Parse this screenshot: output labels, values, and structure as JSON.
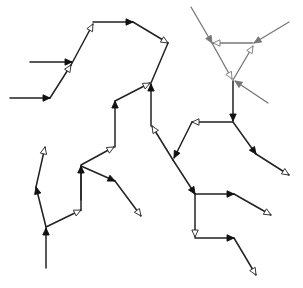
{
  "diagram": {
    "title": "",
    "colors": {
      "edge_primary": "#222222",
      "edge_secondary": "#777777",
      "arrow_filled": "#111111",
      "arrow_open_fill": "#ffffff",
      "background": "#ffffff"
    },
    "edges": [
      {
        "id": "e1",
        "from": [
          30,
          62
        ],
        "to": [
          72,
          62
        ],
        "head": "filled",
        "style": "primary"
      },
      {
        "id": "e2",
        "from": [
          10,
          98
        ],
        "to": [
          50,
          98
        ],
        "head": "filled",
        "style": "primary"
      },
      {
        "id": "e3",
        "from": [
          50,
          98
        ],
        "to": [
          71,
          65
        ],
        "head": "open",
        "style": "primary"
      },
      {
        "id": "e4",
        "from": [
          71,
          65
        ],
        "to": [
          93,
          24
        ],
        "head": "open",
        "style": "primary"
      },
      {
        "id": "e5",
        "from": [
          93,
          22
        ],
        "to": [
          133,
          22
        ],
        "head": "filled",
        "style": "primary"
      },
      {
        "id": "e6",
        "from": [
          133,
          22
        ],
        "to": [
          168,
          43
        ],
        "head": "open",
        "style": "primary"
      },
      {
        "id": "e7",
        "from": [
          168,
          43
        ],
        "to": [
          151,
          83
        ],
        "head": "none",
        "style": "primary"
      },
      {
        "id": "e8",
        "from": [
          115,
          101
        ],
        "to": [
          150,
          83
        ],
        "head": "open",
        "style": "primary"
      },
      {
        "id": "e9",
        "from": [
          151,
          126
        ],
        "to": [
          151,
          84
        ],
        "head": "filled",
        "style": "primary"
      },
      {
        "id": "e10",
        "from": [
          173,
          160
        ],
        "to": [
          152,
          126
        ],
        "head": "open",
        "style": "primary"
      },
      {
        "id": "e11",
        "from": [
          115,
          147
        ],
        "to": [
          115,
          101
        ],
        "head": "filled",
        "style": "primary"
      },
      {
        "id": "e12",
        "from": [
          81,
          165
        ],
        "to": [
          114,
          147
        ],
        "head": "open",
        "style": "primary"
      },
      {
        "id": "e13",
        "from": [
          81,
          200
        ],
        "to": [
          81,
          166
        ],
        "head": "none",
        "style": "primary"
      },
      {
        "id": "e14",
        "from": [
          81,
          166
        ],
        "to": [
          115,
          181
        ],
        "head": "filled",
        "style": "primary"
      },
      {
        "id": "e15",
        "from": [
          115,
          181
        ],
        "to": [
          141,
          216
        ],
        "head": "open",
        "style": "primary"
      },
      {
        "id": "e16",
        "from": [
          46,
          268
        ],
        "to": [
          46,
          228
        ],
        "head": "filled",
        "style": "primary"
      },
      {
        "id": "e17",
        "from": [
          46,
          227
        ],
        "to": [
          81,
          210
        ],
        "head": "open",
        "style": "primary"
      },
      {
        "id": "e18",
        "from": [
          81,
          210
        ],
        "to": [
          81,
          166
        ],
        "head": "filled",
        "style": "primary"
      },
      {
        "id": "e19",
        "from": [
          46,
          227
        ],
        "to": [
          36,
          187
        ],
        "head": "filled",
        "style": "primary"
      },
      {
        "id": "e20",
        "from": [
          36,
          187
        ],
        "to": [
          45,
          147
        ],
        "head": "open",
        "style": "primary"
      },
      {
        "id": "e21",
        "from": [
          173,
          160
        ],
        "to": [
          195,
          194
        ],
        "head": "filled",
        "style": "primary"
      },
      {
        "id": "e22",
        "from": [
          195,
          194
        ],
        "to": [
          234,
          194
        ],
        "head": "filled",
        "style": "primary"
      },
      {
        "id": "e23",
        "from": [
          234,
          194
        ],
        "to": [
          271,
          215
        ],
        "head": "open",
        "style": "primary"
      },
      {
        "id": "e24",
        "from": [
          195,
          194
        ],
        "to": [
          195,
          237
        ],
        "head": "open",
        "style": "primary"
      },
      {
        "id": "e25",
        "from": [
          195,
          238
        ],
        "to": [
          234,
          238
        ],
        "head": "filled",
        "style": "primary"
      },
      {
        "id": "e26",
        "from": [
          234,
          238
        ],
        "to": [
          256,
          275
        ],
        "head": "open",
        "style": "primary"
      },
      {
        "id": "e27",
        "from": [
          233,
          122
        ],
        "to": [
          192,
          122
        ],
        "head": "open",
        "style": "primary"
      },
      {
        "id": "e28",
        "from": [
          192,
          122
        ],
        "to": [
          174,
          158
        ],
        "head": "filled",
        "style": "primary"
      },
      {
        "id": "e29",
        "from": [
          233,
          81
        ],
        "to": [
          233,
          121
        ],
        "head": "filled",
        "style": "primary"
      },
      {
        "id": "e30",
        "from": [
          233,
          122
        ],
        "to": [
          256,
          154
        ],
        "head": "filled",
        "style": "primary"
      },
      {
        "id": "e31",
        "from": [
          256,
          154
        ],
        "to": [
          289,
          175
        ],
        "head": "open",
        "style": "primary"
      },
      {
        "id": "e32",
        "from": [
          191,
          7
        ],
        "to": [
          212,
          43
        ],
        "head": "filled",
        "style": "secondary"
      },
      {
        "id": "e33",
        "from": [
          253,
          43
        ],
        "to": [
          213,
          43
        ],
        "head": "open",
        "style": "secondary"
      },
      {
        "id": "e34",
        "from": [
          289,
          22
        ],
        "to": [
          254,
          43
        ],
        "head": "filled",
        "style": "secondary"
      },
      {
        "id": "e35",
        "from": [
          212,
          43
        ],
        "to": [
          232,
          79
        ],
        "head": "open",
        "style": "secondary"
      },
      {
        "id": "e36",
        "from": [
          233,
          80
        ],
        "to": [
          253,
          46
        ],
        "head": "open",
        "style": "secondary"
      },
      {
        "id": "e37",
        "from": [
          268,
          103
        ],
        "to": [
          235,
          81
        ],
        "head": "filled",
        "style": "secondary"
      }
    ]
  }
}
